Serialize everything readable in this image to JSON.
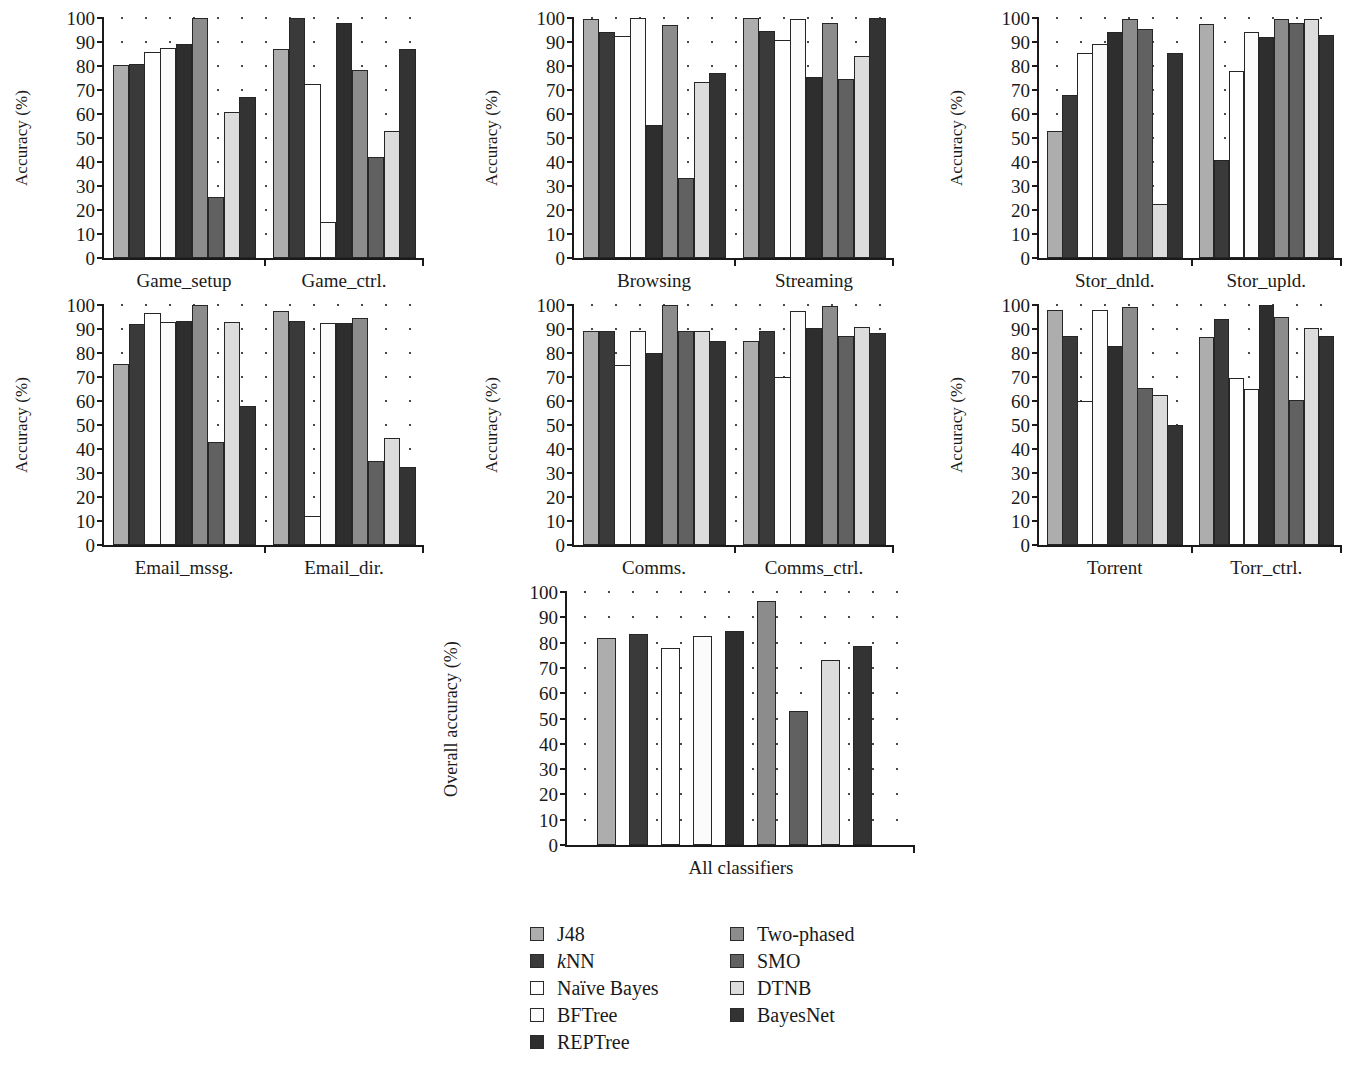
{
  "figure": {
    "type": "bar-chart-grid",
    "panel_count": 7,
    "y_axis_ticks": [
      "100",
      "90",
      "80",
      "70",
      "60",
      "50",
      "40",
      "30",
      "20",
      "10",
      "0"
    ],
    "ylabel_default": "Accuracy (%)",
    "ylabel_overall": "Overall accuracy (%)"
  },
  "legend": {
    "columns": [
      {
        "items": [
          {
            "label": "J48",
            "color": "#adadad"
          },
          {
            "label": "kNN",
            "color": "#3a3a3a",
            "italic_prefix": "k",
            "rest": "NN"
          },
          {
            "label": "Naïve Bayes",
            "color": "#ffffff"
          },
          {
            "label": "BFTree",
            "color": "#fbfbfb"
          },
          {
            "label": "REPTree",
            "color": "#2e2e2e"
          }
        ]
      },
      {
        "items": [
          {
            "label": "Two-phased",
            "color": "#8c8c8c"
          },
          {
            "label": "SMO",
            "color": "#616161"
          },
          {
            "label": "DTNB",
            "color": "#dcdcdc"
          },
          {
            "label": "BayesNet",
            "color": "#333333"
          }
        ]
      }
    ]
  },
  "chart_data": [
    {
      "id": "games",
      "type": "bar",
      "title": "",
      "xlabel": "",
      "ylabel": "Accuracy (%)",
      "ylim": [
        0,
        100
      ],
      "yticks": [
        0,
        10,
        20,
        30,
        40,
        50,
        60,
        70,
        80,
        90,
        100
      ],
      "grid": true,
      "categories": [
        "Game_setup",
        "Game_ctrl."
      ],
      "series": [
        {
          "name": "J48",
          "values": [
            80.5,
            87.0
          ]
        },
        {
          "name": "kNN",
          "values": [
            81.0,
            100.0
          ]
        },
        {
          "name": "Naïve Bayes",
          "values": [
            86.0,
            72.5
          ]
        },
        {
          "name": "BFTree",
          "values": [
            87.5,
            15.0
          ]
        },
        {
          "name": "REPTree",
          "values": [
            89.0,
            98.0
          ]
        },
        {
          "name": "Two-phased",
          "values": [
            100.0,
            78.5
          ]
        },
        {
          "name": "SMO",
          "values": [
            25.5,
            42.0
          ]
        },
        {
          "name": "DTNB",
          "values": [
            61.0,
            53.0
          ]
        },
        {
          "name": "BayesNet",
          "values": [
            67.0,
            87.0
          ]
        }
      ]
    },
    {
      "id": "browsing-streaming",
      "type": "bar",
      "title": "",
      "xlabel": "",
      "ylabel": "Accuracy (%)",
      "ylim": [
        0,
        100
      ],
      "yticks": [
        0,
        10,
        20,
        30,
        40,
        50,
        60,
        70,
        80,
        90,
        100
      ],
      "grid": true,
      "categories": [
        "Browsing",
        "Streaming"
      ],
      "series": [
        {
          "name": "J48",
          "values": [
            99.5,
            100.0
          ]
        },
        {
          "name": "kNN",
          "values": [
            94.0,
            94.5
          ]
        },
        {
          "name": "Naïve Bayes",
          "values": [
            92.5,
            91.0
          ]
        },
        {
          "name": "BFTree",
          "values": [
            100.0,
            99.5
          ]
        },
        {
          "name": "REPTree",
          "values": [
            55.5,
            75.5
          ]
        },
        {
          "name": "Two-phased",
          "values": [
            97.0,
            98.0
          ]
        },
        {
          "name": "SMO",
          "values": [
            33.5,
            74.5
          ]
        },
        {
          "name": "DTNB",
          "values": [
            73.5,
            84.0
          ]
        },
        {
          "name": "BayesNet",
          "values": [
            77.0,
            100.0
          ]
        }
      ]
    },
    {
      "id": "storage",
      "type": "bar",
      "title": "",
      "xlabel": "",
      "ylabel": "Accuracy (%)",
      "ylim": [
        0,
        100
      ],
      "yticks": [
        0,
        10,
        20,
        30,
        40,
        50,
        60,
        70,
        80,
        90,
        100
      ],
      "grid": true,
      "categories": [
        "Stor_dnld.",
        "Stor_upld."
      ],
      "series": [
        {
          "name": "J48",
          "values": [
            53.0,
            97.5
          ]
        },
        {
          "name": "kNN",
          "values": [
            68.0,
            41.0
          ]
        },
        {
          "name": "Naïve Bayes",
          "values": [
            85.5,
            78.0
          ]
        },
        {
          "name": "BFTree",
          "values": [
            89.0,
            94.0
          ]
        },
        {
          "name": "REPTree",
          "values": [
            94.0,
            92.0
          ]
        },
        {
          "name": "Two-phased",
          "values": [
            99.5,
            99.5
          ]
        },
        {
          "name": "SMO",
          "values": [
            95.5,
            98.0
          ]
        },
        {
          "name": "DTNB",
          "values": [
            22.5,
            99.5
          ]
        },
        {
          "name": "BayesNet",
          "values": [
            85.5,
            93.0
          ]
        }
      ]
    },
    {
      "id": "email",
      "type": "bar",
      "title": "",
      "xlabel": "",
      "ylabel": "Accuracy (%)",
      "ylim": [
        0,
        100
      ],
      "yticks": [
        0,
        10,
        20,
        30,
        40,
        50,
        60,
        70,
        80,
        90,
        100
      ],
      "grid": true,
      "categories": [
        "Email_mssg.",
        "Email_dir."
      ],
      "series": [
        {
          "name": "J48",
          "values": [
            75.5,
            97.5
          ]
        },
        {
          "name": "kNN",
          "values": [
            92.0,
            93.5
          ]
        },
        {
          "name": "Naïve Bayes",
          "values": [
            96.5,
            12.0
          ]
        },
        {
          "name": "BFTree",
          "values": [
            93.0,
            92.5
          ]
        },
        {
          "name": "REPTree",
          "values": [
            93.5,
            92.5
          ]
        },
        {
          "name": "Two-phased",
          "values": [
            100.0,
            94.5
          ]
        },
        {
          "name": "SMO",
          "values": [
            43.0,
            35.0
          ]
        },
        {
          "name": "DTNB",
          "values": [
            93.0,
            44.5
          ]
        },
        {
          "name": "BayesNet",
          "values": [
            58.0,
            32.5
          ]
        }
      ]
    },
    {
      "id": "comms",
      "type": "bar",
      "title": "",
      "xlabel": "",
      "ylabel": "Accuracy (%)",
      "ylim": [
        0,
        100
      ],
      "yticks": [
        0,
        10,
        20,
        30,
        40,
        50,
        60,
        70,
        80,
        90,
        100
      ],
      "grid": true,
      "categories": [
        "Comms.",
        "Comms_ctrl."
      ],
      "series": [
        {
          "name": "J48",
          "values": [
            89.0,
            85.0
          ]
        },
        {
          "name": "kNN",
          "values": [
            89.0,
            89.0
          ]
        },
        {
          "name": "Naïve Bayes",
          "values": [
            75.0,
            70.0
          ]
        },
        {
          "name": "BFTree",
          "values": [
            89.0,
            97.5
          ]
        },
        {
          "name": "REPTree",
          "values": [
            80.0,
            90.5
          ]
        },
        {
          "name": "Two-phased",
          "values": [
            100.0,
            99.5
          ]
        },
        {
          "name": "SMO",
          "values": [
            89.0,
            87.0
          ]
        },
        {
          "name": "DTNB",
          "values": [
            89.0,
            91.0
          ]
        },
        {
          "name": "BayesNet",
          "values": [
            85.0,
            88.5
          ]
        }
      ]
    },
    {
      "id": "torrent",
      "type": "bar",
      "title": "",
      "xlabel": "",
      "ylabel": "Accuracy (%)",
      "ylim": [
        0,
        100
      ],
      "yticks": [
        0,
        10,
        20,
        30,
        40,
        50,
        60,
        70,
        80,
        90,
        100
      ],
      "grid": true,
      "categories": [
        "Torrent",
        "Torr_ctrl."
      ],
      "series": [
        {
          "name": "J48",
          "values": [
            98.0,
            86.5
          ]
        },
        {
          "name": "kNN",
          "values": [
            87.0,
            94.0
          ]
        },
        {
          "name": "Naïve Bayes",
          "values": [
            60.0,
            69.5
          ]
        },
        {
          "name": "BFTree",
          "values": [
            98.0,
            65.0
          ]
        },
        {
          "name": "REPTree",
          "values": [
            83.0,
            100.0
          ]
        },
        {
          "name": "Two-phased",
          "values": [
            99.0,
            95.0
          ]
        },
        {
          "name": "SMO",
          "values": [
            65.5,
            60.5
          ]
        },
        {
          "name": "DTNB",
          "values": [
            62.5,
            90.5
          ]
        },
        {
          "name": "BayesNet",
          "values": [
            50.0,
            87.0
          ]
        }
      ]
    },
    {
      "id": "overall",
      "type": "bar",
      "title": "",
      "xlabel": "",
      "ylabel": "Overall accuracy (%)",
      "ylim": [
        0,
        100
      ],
      "yticks": [
        0,
        10,
        20,
        30,
        40,
        50,
        60,
        70,
        80,
        90,
        100
      ],
      "grid": true,
      "categories": [
        "All classifiers"
      ],
      "series": [
        {
          "name": "J48",
          "values": [
            82.0
          ]
        },
        {
          "name": "kNN",
          "values": [
            83.5
          ]
        },
        {
          "name": "Naïve Bayes",
          "values": [
            78.0
          ]
        },
        {
          "name": "BFTree",
          "values": [
            82.5
          ]
        },
        {
          "name": "REPTree",
          "values": [
            84.5
          ]
        },
        {
          "name": "Two-phased",
          "values": [
            96.5
          ]
        },
        {
          "name": "SMO",
          "values": [
            53.0
          ]
        },
        {
          "name": "DTNB",
          "values": [
            73.0
          ]
        },
        {
          "name": "BayesNet",
          "values": [
            78.5
          ]
        }
      ]
    }
  ],
  "layout": {
    "panels": [
      {
        "id": "games",
        "x": 20,
        "y": 18,
        "w": 400,
        "h": 240,
        "plot_left": 82,
        "plot_w": 320,
        "ylabel": "Accuracy (%)"
      },
      {
        "id": "browsing-streaming",
        "x": 490,
        "y": 18,
        "w": 400,
        "h": 240,
        "plot_left": 82,
        "plot_w": 320,
        "ylabel": "Accuracy (%)"
      },
      {
        "id": "storage",
        "x": 955,
        "y": 18,
        "w": 385,
        "h": 240,
        "plot_left": 82,
        "plot_w": 303,
        "ylabel": "Accuracy (%)"
      },
      {
        "id": "email",
        "x": 20,
        "y": 305,
        "w": 400,
        "h": 240,
        "plot_left": 82,
        "plot_w": 320,
        "ylabel": "Accuracy (%)"
      },
      {
        "id": "comms",
        "x": 490,
        "y": 305,
        "w": 400,
        "h": 240,
        "plot_left": 82,
        "plot_w": 320,
        "ylabel": "Accuracy (%)"
      },
      {
        "id": "torrent",
        "x": 955,
        "y": 305,
        "w": 385,
        "h": 240,
        "plot_left": 82,
        "plot_w": 303,
        "ylabel": "Accuracy (%)"
      },
      {
        "id": "overall",
        "x": 455,
        "y": 592,
        "w": 460,
        "h": 253,
        "plot_left": 110,
        "plot_w": 348,
        "ylabel": "Overall accuracy (%)"
      }
    ],
    "legend": {
      "x": 530,
      "y": 920,
      "col2_offset": 200
    }
  }
}
